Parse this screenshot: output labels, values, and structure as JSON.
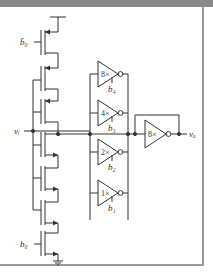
{
  "figure": {
    "type": "circuit-schematic",
    "colors": {
      "stroke": "#333333",
      "top_band": "#8a8a8a",
      "frame": "#9a9a9a"
    }
  },
  "labels": {
    "input": "vᵢ",
    "output": "vₒ",
    "gate_top": "b̄₀",
    "gate_bottom": "b₀"
  },
  "inverters": [
    {
      "gain": "8×",
      "control": "b₄"
    },
    {
      "gain": "4×",
      "control": "b₃"
    },
    {
      "gain": "2×",
      "control": "b₂"
    },
    {
      "gain": "1×",
      "control": "b₁"
    }
  ],
  "output_inverter": {
    "gain": "8×"
  }
}
